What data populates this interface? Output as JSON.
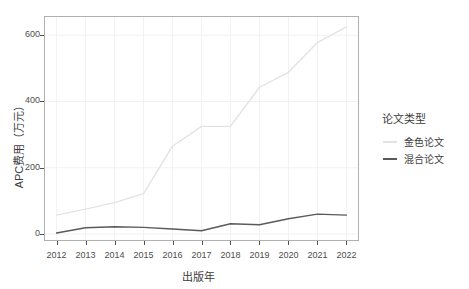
{
  "chart_data": {
    "type": "line",
    "title": "",
    "xlabel": "出版年",
    "ylabel": "APC费用（万元）",
    "x": [
      2012,
      2013,
      2014,
      2015,
      2016,
      2017,
      2018,
      2019,
      2020,
      2021,
      2022
    ],
    "categories": [
      "2012",
      "2013",
      "2014",
      "2015",
      "2016",
      "2017",
      "2018",
      "2019",
      "2020",
      "2021",
      "2022"
    ],
    "xlim": [
      2011.6,
      2022.4
    ],
    "ylim": [
      -18,
      655
    ],
    "yticks": [
      0,
      200,
      400,
      600
    ],
    "ytick_labels": [
      "0",
      "200",
      "400",
      "600"
    ],
    "grid": true,
    "legend_position": "right",
    "legend_title": "论文类型",
    "series": [
      {
        "name": "金色论文",
        "color": "#e3e3e3",
        "values": [
          57,
          75,
          95,
          122,
          265,
          325,
          325,
          443,
          488,
          578,
          625
        ]
      },
      {
        "name": "混合论文",
        "color": "#5a5a5a",
        "values": [
          3,
          19,
          22,
          20,
          15,
          10,
          31,
          28,
          46,
          60,
          57
        ]
      }
    ]
  },
  "axis": {
    "y_title": "APC费用（万元）",
    "x_title": "出版年"
  },
  "legend": {
    "title": "论文类型",
    "items": [
      {
        "label": "金色论文",
        "color": "#e3e3e3"
      },
      {
        "label": "混合论文",
        "color": "#5a5a5a"
      }
    ]
  },
  "colors": {
    "panel_background": "#ffffff",
    "panel_border": "#b0b0b0",
    "grid": "#f2f2f2",
    "text": "#3d3d3d",
    "tick_text": "#4d4d4d",
    "gold_series": "#e3e3e3",
    "hybrid_series": "#5a5a5a"
  }
}
